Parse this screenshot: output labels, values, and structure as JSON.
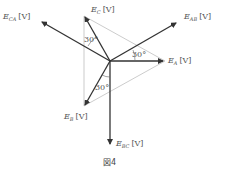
{
  "figure": {
    "caption": "図4",
    "colors": {
      "phasor": "#333333",
      "guide": "#aaaaaa",
      "text": "#555555"
    },
    "center": [
      110,
      61
    ],
    "phasors": [
      {
        "id": "E_A",
        "symbol": "E",
        "sub": "A",
        "unit": "[V]",
        "tip": [
          165,
          61
        ]
      },
      {
        "id": "E_B",
        "symbol": "E",
        "sub": "B",
        "unit": "[V]",
        "tip": [
          84,
          106
        ]
      },
      {
        "id": "E_C",
        "symbol": "E",
        "sub": "C",
        "unit": "[V]",
        "tip": [
          84,
          16
        ]
      },
      {
        "id": "E_AB",
        "symbol": "E",
        "sub": "AB",
        "unit": "[V]",
        "tip": [
          178,
          22
        ]
      },
      {
        "id": "E_BC",
        "symbol": "E",
        "sub": "BC",
        "unit": "[V]",
        "tip": [
          110,
          146
        ]
      },
      {
        "id": "E_CA",
        "symbol": "E",
        "sub": "CA",
        "unit": "[V]",
        "tip": [
          40,
          21
        ]
      }
    ],
    "angles": [
      {
        "label": "30°",
        "near": "E_C / E_CA"
      },
      {
        "label": "30°",
        "near": "E_A / E_AB"
      },
      {
        "label": "30°",
        "near": "E_B / E_BC"
      }
    ]
  }
}
